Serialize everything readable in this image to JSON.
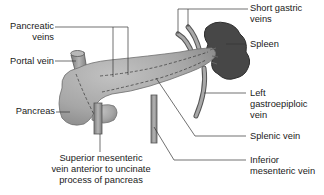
{
  "diagram": {
    "type": "anatomical-labeled-illustration",
    "colors": {
      "pancreas_fill": "#a9a9a9",
      "pancreas_shade": "#8c8c8c",
      "spleen_fill": "#4a4a4a",
      "vein_fill": "#9a9a9a",
      "vein_stroke": "#555555",
      "leader_line": "#333333",
      "text": "#1a1a1a",
      "background": "#ffffff"
    }
  },
  "labels": {
    "pancreatic_veins": {
      "line1": "Pancreatic",
      "line2": "veins"
    },
    "portal_vein": {
      "line1": "Portal vein"
    },
    "pancreas": {
      "line1": "Pancreas"
    },
    "superior_mesenteric": {
      "line1": "Superior mesenteric",
      "line2": "vein anterior to uncinate",
      "line3": "process of pancreas"
    },
    "short_gastric": {
      "line1": "Short gastric",
      "line2": "veins"
    },
    "spleen": {
      "line1": "Spleen"
    },
    "left_gastroepiploic": {
      "line1": "Left",
      "line2": "gastroepiploic",
      "line3": "vein"
    },
    "splenic_vein": {
      "line1": "Splenic vein"
    },
    "inferior_mesenteric": {
      "line1": "Inferior",
      "line2": "mesenteric vein"
    }
  }
}
